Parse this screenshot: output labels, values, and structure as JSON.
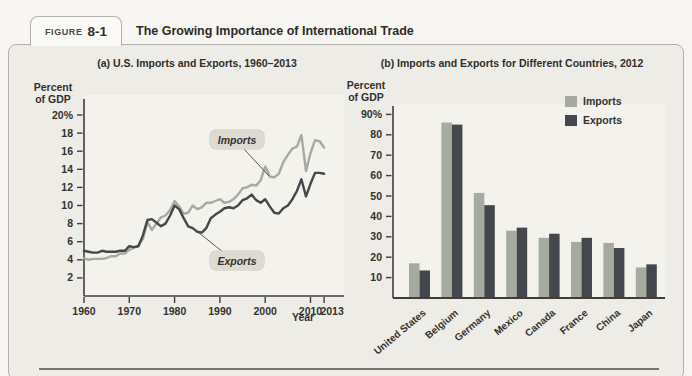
{
  "figure": {
    "tab_prefix": "FIGURE",
    "tab_number": "8-1",
    "title": "The Growing Importance of International Trade"
  },
  "colors": {
    "imports": "#a6aba0",
    "exports": "#44474b",
    "text": "#33322e",
    "axis": "#3f3e3a",
    "plot_bg": "#f3f2ed",
    "callout_bg": "#dcdad1"
  },
  "chart_data": [
    {
      "type": "line",
      "title": "(a) U.S. Imports and Exports, 1960–2013",
      "ylabel": "Percent of GDP",
      "xlabel": "Year",
      "x_start": 1960,
      "x_end": 2013,
      "ylim": [
        0,
        21
      ],
      "yticks": [
        2,
        4,
        6,
        8,
        10,
        12,
        14,
        16,
        18,
        20
      ],
      "y_top_label": "20%",
      "xticks": [
        1960,
        1970,
        1980,
        1990,
        2000,
        2010,
        2013
      ],
      "series": [
        {
          "name": "Imports",
          "values": [
            4.2,
            4.0,
            4.1,
            4.1,
            4.1,
            4.2,
            4.4,
            4.4,
            4.7,
            4.7,
            5.1,
            5.3,
            5.6,
            6.3,
            8.2,
            7.3,
            8.0,
            8.7,
            8.9,
            9.5,
            10.5,
            9.9,
            9.1,
            9.2,
            10.0,
            9.6,
            9.8,
            10.3,
            10.3,
            10.5,
            10.7,
            10.3,
            10.4,
            10.7,
            11.2,
            11.9,
            12.0,
            12.3,
            12.2,
            12.8,
            14.3,
            13.2,
            13.1,
            13.5,
            14.8,
            15.6,
            16.3,
            16.5,
            17.8,
            13.8,
            15.8,
            17.2,
            17.1,
            16.4
          ]
        },
        {
          "name": "Exports",
          "values": [
            5.0,
            4.9,
            4.8,
            4.8,
            5.0,
            4.9,
            4.9,
            4.9,
            5.0,
            5.0,
            5.5,
            5.4,
            5.5,
            6.7,
            8.4,
            8.5,
            8.1,
            7.7,
            8.0,
            8.9,
            10.0,
            9.6,
            8.6,
            7.7,
            7.5,
            7.1,
            7.0,
            7.5,
            8.6,
            9.0,
            9.3,
            9.7,
            9.8,
            9.7,
            10.0,
            10.6,
            10.8,
            11.2,
            10.6,
            10.3,
            10.7,
            9.9,
            9.2,
            9.1,
            9.7,
            10.0,
            10.7,
            11.6,
            12.9,
            11.0,
            12.4,
            13.6,
            13.6,
            13.5
          ]
        }
      ],
      "annotations": [
        {
          "text": "Imports"
        },
        {
          "text": "Exports"
        }
      ]
    },
    {
      "type": "bar",
      "title": "(b) Imports and Exports for Different Countries, 2012",
      "ylabel": "Percent of GDP",
      "ylim": [
        0,
        95
      ],
      "yticks": [
        10,
        20,
        30,
        40,
        50,
        60,
        70,
        80,
        90
      ],
      "y_top_label": "90%",
      "categories": [
        "United States",
        "Belgium",
        "Germany",
        "Mexico",
        "Canada",
        "France",
        "China",
        "Japan"
      ],
      "series": [
        {
          "name": "Imports",
          "values": [
            17,
            86,
            51.5,
            33,
            29.5,
            27.5,
            27,
            15
          ]
        },
        {
          "name": "Exports",
          "values": [
            13.5,
            85,
            45.5,
            34.5,
            31.5,
            29.5,
            24.5,
            16.5
          ]
        }
      ],
      "legend_position": "top-right"
    }
  ]
}
